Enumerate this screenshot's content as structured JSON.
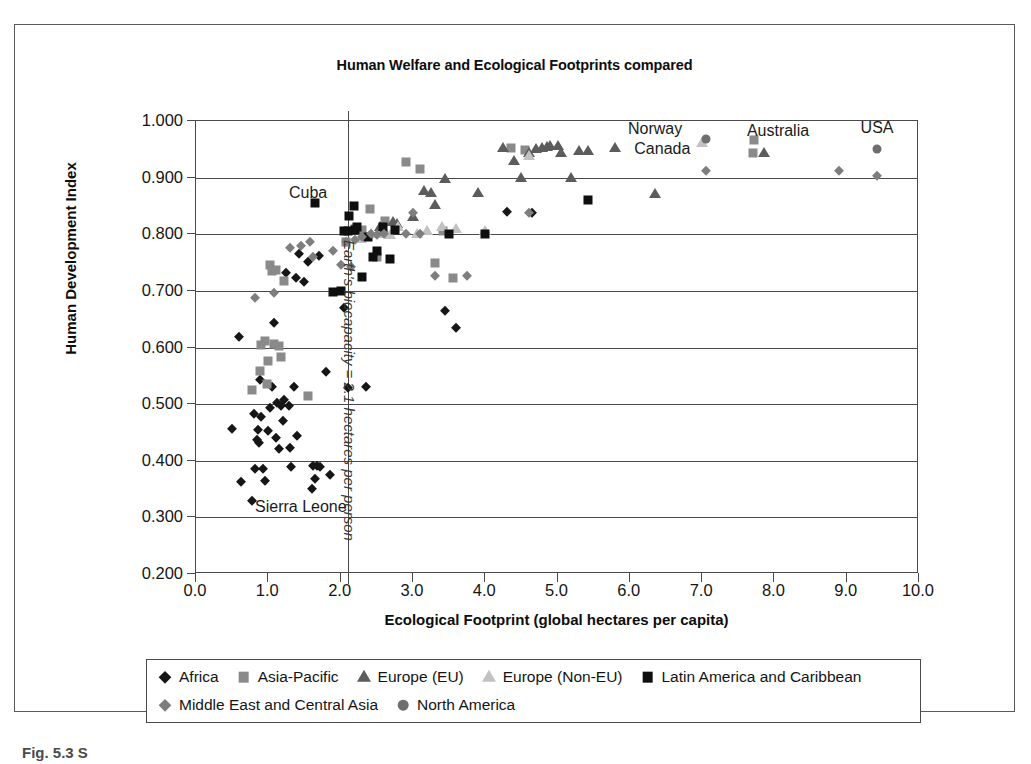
{
  "figure": {
    "caption": "Fig. 5.3 S"
  },
  "chart_data": {
    "type": "scatter",
    "title": "Human Welfare and Ecological Footprints compared",
    "xlabel": "Ecological Footprint (global hectares per capita)",
    "ylabel": "Human Development Index",
    "xlim": [
      0.0,
      10.0
    ],
    "ylim": [
      0.2,
      1.0
    ],
    "xticks": [
      "0.0",
      "1.0",
      "2.0",
      "3.0",
      "4.0",
      "5.0",
      "6.0",
      "7.0",
      "8.0",
      "9.0",
      "10.0"
    ],
    "yticks": [
      "1.000",
      "0.900",
      "0.800",
      "0.700",
      "0.600",
      "0.500",
      "0.400",
      "0.300",
      "0.200"
    ],
    "grid": "horizontal",
    "legend_position": "below-plot",
    "annotations": [
      {
        "text": "Cuba",
        "x": 1.55,
        "y": 0.872
      },
      {
        "text": "Sierra Leone",
        "x": 1.45,
        "y": 0.318
      },
      {
        "text": "Norway",
        "x": 6.35,
        "y": 0.986
      },
      {
        "text": "Canada",
        "x": 6.45,
        "y": 0.95
      },
      {
        "text": "Australia",
        "x": 8.05,
        "y": 0.983
      },
      {
        "text": "USA",
        "x": 9.42,
        "y": 0.988
      },
      {
        "text": "Earth's biocapacity = 2.1 hectares per person",
        "x": 2.1,
        "y": 0.79,
        "rotated": true
      }
    ],
    "series": [
      {
        "name": "Africa",
        "marker": "diamond",
        "color": "#161616",
        "points": [
          [
            0.5,
            0.456
          ],
          [
            0.6,
            0.619
          ],
          [
            0.62,
            0.362
          ],
          [
            0.78,
            0.329
          ],
          [
            0.8,
            0.482
          ],
          [
            0.82,
            0.385
          ],
          [
            0.85,
            0.436
          ],
          [
            0.86,
            0.455
          ],
          [
            0.87,
            0.432
          ],
          [
            0.88,
            0.543
          ],
          [
            0.9,
            0.478
          ],
          [
            0.92,
            0.386
          ],
          [
            0.95,
            0.365
          ],
          [
            1.0,
            0.452
          ],
          [
            1.02,
            0.494
          ],
          [
            1.05,
            0.531
          ],
          [
            1.08,
            0.644
          ],
          [
            1.1,
            0.441
          ],
          [
            1.12,
            0.502
          ],
          [
            1.15,
            0.421
          ],
          [
            1.18,
            0.497
          ],
          [
            1.2,
            0.47
          ],
          [
            1.22,
            0.508
          ],
          [
            1.25,
            0.732
          ],
          [
            1.28,
            0.497
          ],
          [
            1.3,
            0.422
          ],
          [
            1.32,
            0.389
          ],
          [
            1.35,
            0.531
          ],
          [
            1.38,
            0.722
          ],
          [
            1.4,
            0.443
          ],
          [
            1.42,
            0.766
          ],
          [
            1.5,
            0.716
          ],
          [
            1.55,
            0.751
          ],
          [
            1.6,
            0.35
          ],
          [
            1.62,
            0.391
          ],
          [
            1.65,
            0.368
          ],
          [
            1.68,
            0.39
          ],
          [
            1.7,
            0.762
          ],
          [
            1.72,
            0.389
          ],
          [
            1.8,
            0.556
          ],
          [
            1.85,
            0.374
          ],
          [
            2.05,
            0.67
          ],
          [
            2.1,
            0.529
          ],
          [
            2.35,
            0.53
          ],
          [
            3.45,
            0.665
          ],
          [
            3.6,
            0.634
          ],
          [
            4.3,
            0.84
          ],
          [
            4.65,
            0.838
          ]
        ]
      },
      {
        "name": "Asia-Pacific",
        "marker": "square",
        "color": "#8a8a8a",
        "points": [
          [
            0.78,
            0.525
          ],
          [
            0.88,
            0.559
          ],
          [
            0.9,
            0.604
          ],
          [
            0.95,
            0.611
          ],
          [
            0.98,
            0.536
          ],
          [
            1.0,
            0.576
          ],
          [
            1.02,
            0.745
          ],
          [
            1.05,
            0.735
          ],
          [
            1.08,
            0.607
          ],
          [
            1.1,
            0.737
          ],
          [
            1.15,
            0.602
          ],
          [
            1.18,
            0.584
          ],
          [
            1.22,
            0.718
          ],
          [
            1.55,
            0.515
          ],
          [
            2.08,
            0.787
          ],
          [
            2.2,
            0.81
          ],
          [
            2.3,
            0.808
          ],
          [
            2.4,
            0.845
          ],
          [
            2.5,
            0.76
          ],
          [
            2.62,
            0.824
          ],
          [
            2.9,
            0.928
          ],
          [
            3.1,
            0.915
          ],
          [
            3.3,
            0.75
          ],
          [
            3.42,
            0.806
          ],
          [
            3.55,
            0.722
          ],
          [
            4.35,
            0.952
          ],
          [
            4.55,
            0.948
          ],
          [
            7.72,
            0.966
          ],
          [
            7.7,
            0.943
          ]
        ]
      },
      {
        "name": "Europe (EU)",
        "marker": "triangle",
        "color": "#5c5c5c",
        "points": [
          [
            2.55,
            0.812
          ],
          [
            2.6,
            0.805
          ],
          [
            2.72,
            0.822
          ],
          [
            2.78,
            0.818
          ],
          [
            3.0,
            0.83
          ],
          [
            3.15,
            0.876
          ],
          [
            3.25,
            0.872
          ],
          [
            3.3,
            0.851
          ],
          [
            3.45,
            0.898
          ],
          [
            3.9,
            0.872
          ],
          [
            4.25,
            0.952
          ],
          [
            4.4,
            0.93
          ],
          [
            4.5,
            0.899
          ],
          [
            4.6,
            0.944
          ],
          [
            4.7,
            0.95
          ],
          [
            4.78,
            0.952
          ],
          [
            4.85,
            0.954
          ],
          [
            4.9,
            0.956
          ],
          [
            5.0,
            0.955
          ],
          [
            5.05,
            0.944
          ],
          [
            5.18,
            0.899
          ],
          [
            5.3,
            0.947
          ],
          [
            5.42,
            0.947
          ],
          [
            5.8,
            0.952
          ],
          [
            6.35,
            0.871
          ],
          [
            7.85,
            0.944
          ]
        ]
      },
      {
        "name": "Europe (Non-EU)",
        "marker": "triangle",
        "color": "#c2c2c2",
        "points": [
          [
            2.28,
            0.792
          ],
          [
            2.42,
            0.8
          ],
          [
            2.62,
            0.8
          ],
          [
            2.68,
            0.798
          ],
          [
            2.8,
            0.812
          ],
          [
            3.05,
            0.8
          ],
          [
            3.2,
            0.806
          ],
          [
            3.4,
            0.812
          ],
          [
            3.6,
            0.81
          ],
          [
            4.0,
            0.805
          ],
          [
            4.6,
            0.938
          ],
          [
            7.0,
            0.962
          ]
        ]
      },
      {
        "name": "Latin America and Caribbean",
        "marker": "square",
        "color": "#0e0e0e",
        "points": [
          [
            1.65,
            0.855
          ],
          [
            1.9,
            0.698
          ],
          [
            2.0,
            0.7
          ],
          [
            2.05,
            0.805
          ],
          [
            2.1,
            0.806
          ],
          [
            2.12,
            0.833
          ],
          [
            2.18,
            0.85
          ],
          [
            2.2,
            0.807
          ],
          [
            2.22,
            0.812
          ],
          [
            2.3,
            0.725
          ],
          [
            2.38,
            0.795
          ],
          [
            2.45,
            0.76
          ],
          [
            2.5,
            0.77
          ],
          [
            2.58,
            0.812
          ],
          [
            2.68,
            0.757
          ],
          [
            2.75,
            0.807
          ],
          [
            3.5,
            0.8
          ],
          [
            4.0,
            0.8
          ],
          [
            5.42,
            0.86
          ]
        ]
      },
      {
        "name": "Middle East and Central Asia",
        "marker": "diamond",
        "color": "#7e7e7e",
        "points": [
          [
            0.82,
            0.688
          ],
          [
            1.08,
            0.696
          ],
          [
            1.3,
            0.775
          ],
          [
            1.45,
            0.78
          ],
          [
            1.58,
            0.787
          ],
          [
            1.62,
            0.76
          ],
          [
            1.9,
            0.77
          ],
          [
            2.0,
            0.745
          ],
          [
            2.08,
            0.786
          ],
          [
            2.15,
            0.742
          ],
          [
            2.2,
            0.79
          ],
          [
            2.3,
            0.796
          ],
          [
            2.42,
            0.8
          ],
          [
            2.5,
            0.798
          ],
          [
            2.6,
            0.8
          ],
          [
            2.9,
            0.8
          ],
          [
            3.0,
            0.838
          ],
          [
            3.1,
            0.8
          ],
          [
            3.3,
            0.726
          ],
          [
            3.75,
            0.727
          ],
          [
            4.6,
            0.838
          ],
          [
            7.05,
            0.912
          ],
          [
            8.9,
            0.912
          ],
          [
            9.42,
            0.902
          ]
        ]
      },
      {
        "name": "North America",
        "marker": "circle",
        "color": "#6e6e6e",
        "points": [
          [
            7.05,
            0.968
          ],
          [
            9.42,
            0.951
          ]
        ]
      }
    ]
  },
  "legend": {
    "rows": [
      [
        {
          "label": "Africa",
          "marker": "diamond",
          "color": "#161616"
        },
        {
          "label": "Asia-Pacific",
          "marker": "square",
          "color": "#8a8a8a"
        },
        {
          "label": "Europe (EU)",
          "marker": "triangle",
          "color": "#5c5c5c"
        },
        {
          "label": "Europe (Non-EU)",
          "marker": "triangle",
          "color": "#c2c2c2"
        },
        {
          "label": "Latin America and Caribbean",
          "marker": "square",
          "color": "#0e0e0e"
        }
      ],
      [
        {
          "label": "Middle East and Central Asia",
          "marker": "diamond",
          "color": "#7e7e7e"
        },
        {
          "label": "North America",
          "marker": "circle",
          "color": "#6e6e6e"
        }
      ]
    ]
  }
}
